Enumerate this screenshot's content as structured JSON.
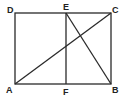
{
  "diagram": {
    "type": "geometry",
    "points": {
      "A": {
        "label": "A",
        "x": 15,
        "y": 84
      },
      "B": {
        "label": "B",
        "x": 111,
        "y": 84
      },
      "C": {
        "label": "C",
        "x": 111,
        "y": 13
      },
      "D": {
        "label": "D",
        "x": 15,
        "y": 13
      },
      "E": {
        "label": "E",
        "x": 66,
        "y": 13
      },
      "F": {
        "label": "F",
        "x": 66,
        "y": 84
      }
    },
    "segments": [
      [
        "A",
        "B"
      ],
      [
        "B",
        "C"
      ],
      [
        "C",
        "D"
      ],
      [
        "D",
        "A"
      ],
      [
        "E",
        "F"
      ],
      [
        "A",
        "C"
      ],
      [
        "E",
        "B"
      ]
    ],
    "colors": {
      "line": "#2a2a2a",
      "background": "#ffffff"
    }
  }
}
